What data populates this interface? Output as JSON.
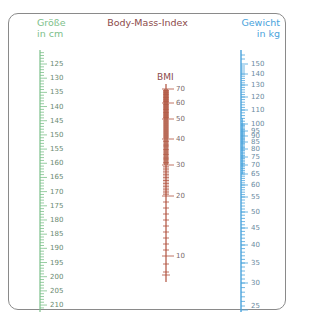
{
  "title": "Body-Mass-Index",
  "height_scale": {
    "label_line1": "Größe",
    "label_line2": "in cm",
    "color": "#7cc08a",
    "labels": [
      "125",
      "130",
      "135",
      "140",
      "145",
      "150",
      "155",
      "160",
      "165",
      "170",
      "175",
      "180",
      "185",
      "190",
      "195",
      "200",
      "205",
      "210"
    ]
  },
  "bmi_scale": {
    "label": "BMI",
    "color": "#b0503c",
    "labels": [
      "70",
      "60",
      "50",
      "40",
      "30",
      "20",
      "10"
    ]
  },
  "weight_scale": {
    "label_line1": "Gewicht",
    "label_line2": "in kg",
    "color": "#4aa3dc",
    "labels": [
      "150",
      "140",
      "130",
      "120",
      "110",
      "100",
      "95",
      "90",
      "85",
      "80",
      "75",
      "70",
      "65",
      "60",
      "55",
      "50",
      "45",
      "40",
      "35",
      "30",
      "25"
    ]
  }
}
